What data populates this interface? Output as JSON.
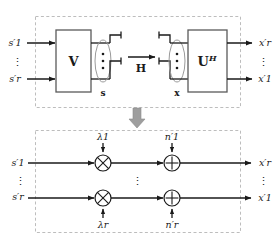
{
  "figure": {
    "colors": {
      "line": "#1a1a1a",
      "dashed_border": "#b9b9b9",
      "block_fill": "#ffffff",
      "block_stroke": "#4d4d4d",
      "transition_arrow": "#9a9a9a",
      "text": "#1a1a1a"
    }
  },
  "top_panel": {
    "name": "precoder-channel-decoder-panel",
    "inputs": [
      {
        "label": "s′1",
        "tex": "s'_1"
      },
      {
        "label": "s′r",
        "tex": "s'_r"
      }
    ],
    "input_vdots": "⋮",
    "precoder_block": {
      "label": "V"
    },
    "transmit_vector_label": "s",
    "channel_label": "H",
    "combiner_block": {
      "label": "U",
      "superscript": "H"
    },
    "receive_vector_label": "x",
    "outputs": [
      {
        "label": "x′r",
        "tex": "x'_r"
      },
      {
        "label": "x′1",
        "tex": "x'_1"
      }
    ],
    "output_vdots": "⋮",
    "antenna_vdots": "⋮"
  },
  "transition": {
    "name": "equivalence-arrow",
    "direction": "down"
  },
  "bottom_panel": {
    "name": "equivalent-parallel-channels-panel",
    "inputs": [
      {
        "label": "s′1",
        "tex": "s'_1"
      },
      {
        "label": "s′r",
        "tex": "s'_r"
      }
    ],
    "gains": [
      {
        "label": "λ1",
        "tex": "\\lambda_1"
      },
      {
        "label": "λr",
        "tex": "\\lambda_r"
      }
    ],
    "noises": [
      {
        "label": "n′1",
        "tex": "n'_1"
      },
      {
        "label": "n′r",
        "tex": "n'_r"
      }
    ],
    "outputs": [
      {
        "label": "x′r",
        "tex": "x'_r"
      },
      {
        "label": "x′1",
        "tex": "x'_1"
      }
    ],
    "multiply_symbol": "⊗",
    "add_symbol": "⊕",
    "vdots": "⋮"
  }
}
